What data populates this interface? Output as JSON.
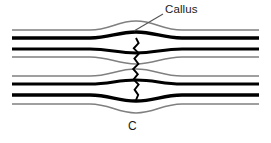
{
  "figure": {
    "panel_label": "C",
    "annotation_label": "Callus",
    "colors": {
      "cortex_dark": "#000000",
      "periosteum_gray": "#808080",
      "background": "#ffffff",
      "text": "#1a1a1a",
      "leader_line": "#555555"
    },
    "structures": {
      "bulge_center_x": 136,
      "bulge_half_width": 46,
      "fracture_line_x": 136,
      "fracture_top_y": 38,
      "fracture_bottom_y": 100
    },
    "lines": [
      {
        "name": "outer-periosteum-superior",
        "y": 30,
        "thickness": 1.6,
        "color": "#808080",
        "bulge": -9
      },
      {
        "name": "outer-cortex-superior",
        "y": 38,
        "thickness": 3.4,
        "color": "#000000",
        "bulge": -6
      },
      {
        "name": "inner-cortex-superior",
        "y": 49,
        "thickness": 3.0,
        "color": "#000000",
        "bulge": 4
      },
      {
        "name": "endosteum-superior",
        "y": 57,
        "thickness": 1.6,
        "color": "#808080",
        "bulge": 7
      },
      {
        "name": "endosteum-inferior",
        "y": 76,
        "thickness": 1.6,
        "color": "#808080",
        "bulge": -7
      },
      {
        "name": "inner-cortex-inferior",
        "y": 84,
        "thickness": 3.0,
        "color": "#000000",
        "bulge": -4
      },
      {
        "name": "outer-cortex-inferior",
        "y": 95,
        "thickness": 3.4,
        "color": "#000000",
        "bulge": 6
      },
      {
        "name": "outer-periosteum-inferior",
        "y": 104,
        "thickness": 1.6,
        "color": "#808080",
        "bulge": 9
      }
    ],
    "leader": {
      "name": "callus-leader-line",
      "from_x": 163,
      "from_y": 14,
      "to_x": 134,
      "to_y": 31
    }
  }
}
